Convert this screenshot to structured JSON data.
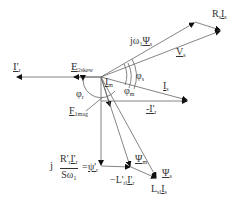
{
  "diagram": {
    "origin": {
      "x": 101,
      "y": 77
    },
    "vectors": [
      {
        "name": "I'r",
        "from": [
          101,
          77
        ],
        "to": [
          16,
          77
        ]
      },
      {
        "name": "E2skew",
        "from": [
          101,
          77
        ],
        "to": [
          73,
          77
        ]
      },
      {
        "name": "j omega1 Psi_s",
        "from": [
          101,
          77
        ],
        "to": [
          195,
          22
        ]
      },
      {
        "name": "Rs Is",
        "from": [
          195,
          22
        ],
        "to": [
          221,
          30
        ]
      },
      {
        "name": "Vs",
        "from": [
          101,
          77
        ],
        "to": [
          221,
          30
        ]
      },
      {
        "name": "Is",
        "from": [
          101,
          77
        ],
        "to": [
          188,
          101
        ]
      },
      {
        "name": "-I'r",
        "from": [
          101,
          101
        ],
        "to": [
          188,
          101
        ]
      },
      {
        "name": "F1mag",
        "from": [
          101,
          77
        ],
        "to": [
          110,
          106
        ]
      },
      {
        "name": "Psi'r",
        "from": [
          101,
          101
        ],
        "to": [
          101,
          166
        ]
      },
      {
        "name": "-L'rl I'r",
        "from": [
          101,
          166
        ],
        "to": [
          131,
          167
        ]
      },
      {
        "name": "Lsl Is",
        "from": [
          131,
          167
        ],
        "to": [
          157,
          178
        ]
      },
      {
        "name": "Psi_m",
        "from": [
          101,
          77
        ],
        "to": [
          131,
          167
        ]
      },
      {
        "name": "Psi_s",
        "from": [
          101,
          77
        ],
        "to": [
          157,
          178
        ]
      }
    ],
    "labels": {
      "ir": "I'",
      "ir_sub": "r",
      "e2skew": "E",
      "e2skew_sub": "2skew",
      "jw": "jω",
      "jw_sub": "1",
      "psi_s_top": "Ψ",
      "psi_s_top_sub": "s",
      "rs": "R",
      "rs_sub": "s",
      "is_after_rs": "I",
      "is_after_rs_sub": "s",
      "vs": "V",
      "vs_sub": "s",
      "phi_s": "φ",
      "phi_s_sub": "s",
      "im": "I",
      "im_sub": "m",
      "phi_m": "φ",
      "phi_m_sub": "m",
      "is": "I",
      "is_sub": "s",
      "phi_r": "φ",
      "phi_r_sub": "r",
      "minus_ir": "-I'",
      "minus_ir_sub": "r",
      "f1mag": "F",
      "f1mag_sub": "1mag",
      "j": "j",
      "frac_num": "R'",
      "frac_num_sub": "r",
      "frac_num2": "I'",
      "frac_num2_sub": "r",
      "frac_den": "Sω",
      "frac_den_sub": "1",
      "eq": "=",
      "psi_r": "ψ'",
      "psi_r_sub": "r",
      "psi_m": "Ψ",
      "psi_m_sub": "m",
      "lrl": "−L'",
      "lrl_sub": "rl",
      "lrl_i": "I'",
      "lrl_i_sub": "r",
      "psi_s": "Ψ",
      "psi_s_sub": "s",
      "lsl": "L",
      "lsl_sub": "sl",
      "lsl_i": "I",
      "lsl_i_sub": "s"
    },
    "line_color": "#555555",
    "text_color": "#333333"
  }
}
